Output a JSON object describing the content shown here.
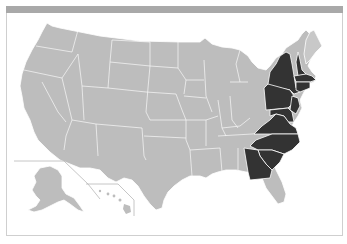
{
  "map": {
    "type": "choropleth",
    "region": "United States",
    "colors": {
      "base": "#bdbdbd",
      "highlight": "#333333",
      "border": "#ffffff",
      "frame_bar": "#a9a9a9",
      "frame_border": "#cfcfcf"
    },
    "highlighted_states": [
      "New York",
      "Pennsylvania",
      "New Jersey",
      "Delaware",
      "Maryland",
      "Connecticut",
      "Rhode Island",
      "Massachusetts",
      "New Hampshire",
      "Virginia",
      "North Carolina",
      "South Carolina",
      "Georgia"
    ],
    "unhighlighted_east_states": [
      "Maine",
      "Vermont",
      "West Virginia",
      "Florida"
    ],
    "insets": [
      "Alaska",
      "Hawaii"
    ]
  }
}
